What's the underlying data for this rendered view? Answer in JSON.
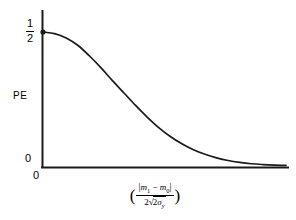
{
  "chart_data": {
    "type": "line",
    "title": "",
    "xlabel": "( |m1 - m0| / (2*sqrt(2) * sigma_y) )",
    "ylabel": "PE",
    "xlim": [
      0,
      4.2
    ],
    "ylim": [
      0,
      0.56
    ],
    "grid": false,
    "legend": null,
    "y_ticks": [
      "1/2",
      "0"
    ],
    "y_tick_values": [
      0.5,
      0
    ],
    "x_ticks": [
      "0"
    ],
    "x_tick_values": [
      0
    ],
    "series": [
      {
        "name": "PE",
        "description": "Probability of error versus normalized mean separation; starts at 1/2, decays monotonically toward 0.",
        "x": [
          0.0,
          0.2,
          0.4,
          0.6,
          0.8,
          1.0,
          1.2,
          1.4,
          1.6,
          1.8,
          2.0,
          2.2,
          2.4,
          2.6,
          2.8,
          3.0,
          3.2,
          3.4,
          3.6,
          3.8,
          4.0,
          4.2
        ],
        "values": [
          0.5,
          0.494,
          0.478,
          0.451,
          0.412,
          0.368,
          0.32,
          0.274,
          0.228,
          0.185,
          0.146,
          0.113,
          0.086,
          0.064,
          0.047,
          0.034,
          0.024,
          0.017,
          0.012,
          0.009,
          0.007,
          0.006
        ]
      }
    ],
    "markers": [
      {
        "name": "start-point",
        "x": 0,
        "y": 0.5
      }
    ]
  },
  "axes": {
    "y_title": "PE",
    "y_tick_top": {
      "numerator": "1",
      "denominator": "2"
    },
    "y_tick_bottom": "0",
    "x_tick_origin": "0"
  },
  "x_axis_label": {
    "open_paren": "(",
    "close_paren": ")",
    "numerator": {
      "left_bar": "|",
      "m_first": "m",
      "sub_first": "1",
      "minus": "−",
      "m_second": "m",
      "sub_second": "0",
      "right_bar": "|"
    },
    "denominator": {
      "coefficient": "2",
      "radical": "√",
      "radicand": "2",
      "sigma": "σ",
      "sigma_subscript": "y"
    }
  },
  "colors": {
    "background": "#ffffff",
    "axis": "#1a1a1a",
    "curve": "#1a1a1a",
    "text": "#000000"
  }
}
